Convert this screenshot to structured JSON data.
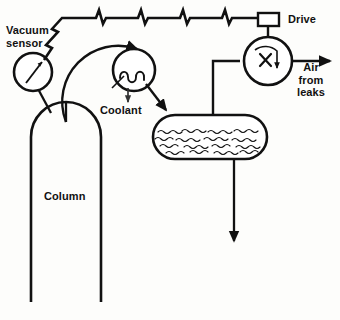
{
  "diagram": {
    "type": "process-flow-schematic",
    "background_color": "#fdfdfb",
    "line_color": "#111111",
    "labels": {
      "vacuum_sensor": "Vacuum\nsensor",
      "coolant": "Coolant",
      "column": "Column",
      "drive": "Drive",
      "air_from_leaks": "Air\nfrom\nleaks"
    },
    "components": [
      {
        "name": "vacuum-sensor-gauge",
        "kind": "circle-gauge",
        "label": "Vacuum sensor"
      },
      {
        "name": "column-vessel",
        "kind": "domed-column",
        "label": "Column"
      },
      {
        "name": "coolant-unit",
        "kind": "circle-coil",
        "label": "Coolant"
      },
      {
        "name": "condenser-vessel",
        "kind": "horizontal-capsule-with-liquid",
        "label": ""
      },
      {
        "name": "vacuum-pump",
        "kind": "circle-pump-with-rotation-arrow",
        "label": ""
      },
      {
        "name": "drive-unit",
        "kind": "rectangle-box",
        "label": "Drive"
      }
    ],
    "flows": [
      {
        "name": "vapor-line-column-to-coolant",
        "style": "arc-arrow"
      },
      {
        "name": "coolant-to-condenser",
        "style": "arrow"
      },
      {
        "name": "coolant-drain",
        "style": "short-arrow-down"
      },
      {
        "name": "condenser-to-pump",
        "style": "pipe"
      },
      {
        "name": "pump-discharge",
        "style": "arrow-right",
        "label": "Air from leaks"
      },
      {
        "name": "condensate-drain",
        "style": "long-arrow-down"
      },
      {
        "name": "vacuum-signal-line",
        "style": "zigzag-lightning"
      }
    ],
    "zigzag_line": {
      "segments": 5,
      "description": "lightning-bolt broken line from vacuum sensor to drive"
    }
  }
}
